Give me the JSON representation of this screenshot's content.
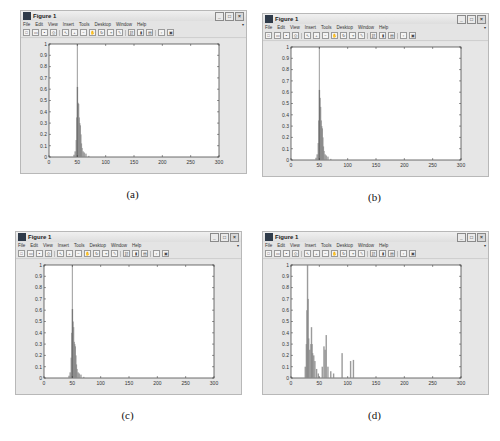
{
  "window": {
    "title": "Figure 1",
    "menu": [
      "File",
      "Edit",
      "View",
      "Insert",
      "Tools",
      "Desktop",
      "Window",
      "Help"
    ],
    "toolbar_icons": [
      "new-figure-icon",
      "open-file-icon",
      "save-icon",
      "print-icon",
      "select-arrow-icon",
      "zoom-in-icon",
      "zoom-out-icon",
      "pan-icon",
      "rotate-3d-icon",
      "data-cursor-icon",
      "brush-icon",
      "link-icon",
      "colorbar-icon",
      "legend-icon",
      "hide-plot-tools-icon",
      "show-plot-tools-icon"
    ],
    "window_buttons": [
      "minimize",
      "maximize",
      "close"
    ]
  },
  "panels": [
    {
      "caption": "(a)",
      "left": 20,
      "top": 10
    },
    {
      "caption": "(b)",
      "left": 262,
      "top": 13
    },
    {
      "caption": "(c)",
      "left": 15,
      "top": 231
    },
    {
      "caption": "(d)",
      "left": 262,
      "top": 231
    }
  ],
  "chart_data": [
    {
      "type": "bar",
      "title": "",
      "caption": "(a)",
      "xlabel": "",
      "ylabel": "",
      "xlim": [
        0,
        300
      ],
      "ylim": [
        0,
        1
      ],
      "xticks": [
        0,
        50,
        100,
        150,
        200,
        250,
        300
      ],
      "yticks": [
        0,
        0.1,
        0.2,
        0.3,
        0.4,
        0.5,
        0.6,
        0.7,
        0.8,
        0.9,
        1
      ],
      "grid": false,
      "marker_line_x": 50,
      "x": [
        44,
        46,
        48,
        49,
        50,
        51,
        52,
        53,
        54,
        55,
        56,
        57,
        58,
        60,
        62,
        65,
        70
      ],
      "values": [
        0.02,
        0.05,
        0.15,
        0.35,
        0.62,
        0.48,
        0.47,
        0.35,
        0.3,
        0.28,
        0.2,
        0.12,
        0.08,
        0.05,
        0.04,
        0.03,
        0.01
      ]
    },
    {
      "type": "bar",
      "title": "",
      "caption": "(b)",
      "xlabel": "",
      "ylabel": "",
      "xlim": [
        0,
        300
      ],
      "ylim": [
        0,
        1
      ],
      "xticks": [
        0,
        50,
        100,
        150,
        200,
        250,
        300
      ],
      "yticks": [
        0,
        0.1,
        0.2,
        0.3,
        0.4,
        0.5,
        0.6,
        0.7,
        0.8,
        0.9,
        1
      ],
      "grid": false,
      "marker_line_x": 50,
      "x": [
        44,
        46,
        48,
        49,
        50,
        51,
        52,
        53,
        54,
        55,
        56,
        57,
        58,
        60,
        62,
        65,
        70
      ],
      "values": [
        0.02,
        0.05,
        0.15,
        0.35,
        0.62,
        0.55,
        0.47,
        0.35,
        0.3,
        0.28,
        0.2,
        0.12,
        0.08,
        0.05,
        0.04,
        0.03,
        0.01
      ]
    },
    {
      "type": "bar",
      "title": "",
      "caption": "(c)",
      "xlabel": "",
      "ylabel": "",
      "xlim": [
        0,
        300
      ],
      "ylim": [
        0,
        1
      ],
      "xticks": [
        0,
        50,
        100,
        150,
        200,
        250,
        300
      ],
      "yticks": [
        0,
        0.1,
        0.2,
        0.3,
        0.4,
        0.5,
        0.6,
        0.7,
        0.8,
        0.9,
        1
      ],
      "grid": false,
      "marker_line_x": 50,
      "x": [
        44,
        46,
        48,
        49,
        50,
        51,
        52,
        53,
        54,
        55,
        56,
        57,
        58,
        60,
        62,
        65,
        70
      ],
      "values": [
        0.02,
        0.05,
        0.18,
        0.4,
        0.61,
        0.5,
        0.45,
        0.32,
        0.3,
        0.28,
        0.2,
        0.12,
        0.08,
        0.05,
        0.04,
        0.03,
        0.01
      ]
    },
    {
      "type": "bar",
      "title": "",
      "caption": "(d)",
      "xlabel": "",
      "ylabel": "",
      "xlim": [
        0,
        300
      ],
      "ylim": [
        0,
        1
      ],
      "xticks": [
        0,
        50,
        100,
        150,
        200,
        250,
        300
      ],
      "yticks": [
        0,
        0.1,
        0.2,
        0.3,
        0.4,
        0.5,
        0.6,
        0.7,
        0.8,
        0.9,
        1
      ],
      "grid": false,
      "marker_line_x": null,
      "x": [
        25,
        27,
        28,
        29,
        30,
        31,
        33,
        35,
        36,
        37,
        38,
        40,
        42,
        45,
        48,
        55,
        58,
        60,
        62,
        65,
        70,
        75,
        90,
        105,
        110
      ],
      "values": [
        0.1,
        0.3,
        0.6,
        1.0,
        0.7,
        0.35,
        0.25,
        0.3,
        0.45,
        0.3,
        0.22,
        0.2,
        0.15,
        0.08,
        0.04,
        0.1,
        0.28,
        0.25,
        0.38,
        0.1,
        0.06,
        0.04,
        0.22,
        0.15,
        0.16
      ]
    }
  ]
}
